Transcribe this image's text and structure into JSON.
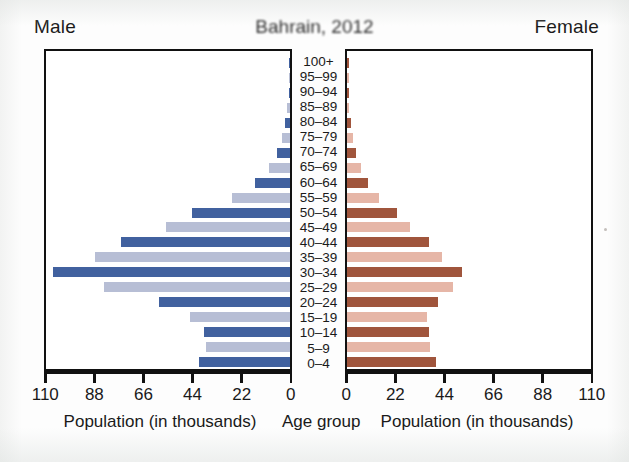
{
  "headings": {
    "male": "Male",
    "female": "Female",
    "title": "Bahrain, 2012"
  },
  "axis_titles": {
    "left": "Population (in thousands)",
    "center": "Age group",
    "right": "Population (in thousands)"
  },
  "colors": {
    "male_dark": "#41619f",
    "male_light": "#b7bed5",
    "female_dark": "#a0553c",
    "female_light": "#e6b6a7",
    "frame": "#111111",
    "background": "#ffffff"
  },
  "chart_data": {
    "type": "bar",
    "subtype": "population-pyramid",
    "title": "Bahrain, 2012",
    "xlabel": "Population (in thousands)",
    "ylabel": "Age group",
    "grid": false,
    "legend": false,
    "xlim": [
      0,
      110
    ],
    "xticks": [
      0,
      22,
      44,
      66,
      88,
      110
    ],
    "left_tick_labels": [
      "110",
      "88",
      "66",
      "44",
      "22",
      "0"
    ],
    "right_tick_labels": [
      "0",
      "22",
      "44",
      "66",
      "88",
      "110"
    ],
    "categories": [
      "100+",
      "95–99",
      "90–94",
      "85–89",
      "80–84",
      "75–79",
      "70–74",
      "65–69",
      "60–64",
      "55–59",
      "50–54",
      "45–49",
      "40–44",
      "35–39",
      "30–34",
      "25–29",
      "20–24",
      "15–19",
      "10–14",
      "5–9",
      "0–4"
    ],
    "series": [
      {
        "name": "Male",
        "side": "left",
        "values": [
          0.1,
          0.3,
          0.6,
          1.2,
          2.3,
          3.6,
          6.0,
          9.5,
          16.0,
          26.0,
          44.0,
          56.0,
          76.0,
          88.0,
          107.0,
          84.0,
          59.0,
          45.0,
          39.0,
          38.0,
          41.0
        ]
      },
      {
        "name": "Female",
        "side": "right",
        "values": [
          0.1,
          0.3,
          0.5,
          1.0,
          1.8,
          2.6,
          4.0,
          6.2,
          9.5,
          14.5,
          22.5,
          28.5,
          37.0,
          43.0,
          52.0,
          48.0,
          41.0,
          36.0,
          37.0,
          37.5,
          40.0
        ]
      }
    ]
  }
}
